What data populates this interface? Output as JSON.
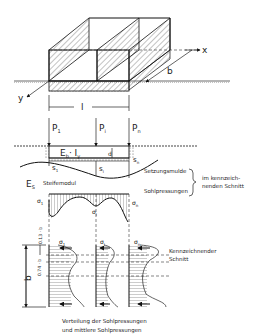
{
  "figure": {
    "top_view": {
      "axis_x": "x",
      "axis_y": "y",
      "width_label": "b",
      "length_label": "l"
    },
    "section": {
      "loads": [
        "P",
        "P",
        "P"
      ],
      "load_subscripts": [
        "1",
        "i",
        "n"
      ],
      "beam_stiffness": "E",
      "beam_stiffness_sub": "b",
      "beam_inertia": "· I",
      "beam_inertia_sub": "y",
      "height_label": "d",
      "settlements": [
        "s",
        "s",
        "s"
      ],
      "settlement_subscripts": [
        "1",
        "i",
        "n"
      ],
      "soil_modulus_symbol": "E",
      "soil_modulus_sub": "S",
      "soil_modulus_label": "Steifemodul",
      "settlement_trough_label": "Setzungsmulde",
      "contact_pressure_label": "Sohlpressungen",
      "brace_label_line1": "im kennzeich-",
      "brace_label_line2": "nenden Schnitt"
    },
    "pressure_diagram": {
      "sigma_labels": [
        "σ",
        "σ",
        "σ"
      ],
      "sigma_subscripts": [
        "1",
        "i",
        "n"
      ]
    },
    "distribution": {
      "dimension_top": "0.13 · b",
      "dimension_mid": "0.74 · b",
      "dimension_b": "b",
      "sigma_labels": [
        "σ",
        "σ",
        "σ"
      ],
      "sigma_subscripts": [
        "1",
        "i",
        "n"
      ],
      "char_section_line1": "Kennzeichnender",
      "char_section_line2": "Schnitt"
    },
    "caption": {
      "line1": "Verteilung der Sohlpressungen",
      "line2": "und mittlere Sohlpressungen"
    }
  }
}
